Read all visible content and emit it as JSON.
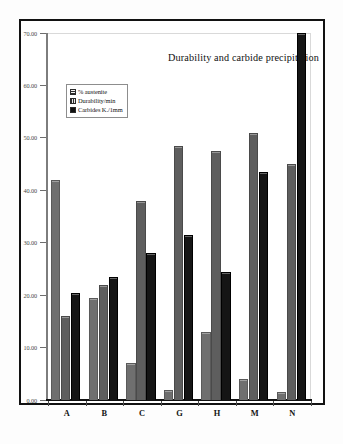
{
  "page": {
    "source_note": "Source: Inst. Paleochem. Sedimentologica"
  },
  "chart_data": {
    "type": "bar",
    "title": "Durability and carbide precipitation",
    "xlabel": "",
    "ylabel": "",
    "ylim": [
      0,
      70
    ],
    "grid": false,
    "legend_position": "top-left",
    "categories": [
      "A",
      "B",
      "C",
      "G",
      "H",
      "M",
      "N"
    ],
    "y_ticks": [
      "0.00",
      "10.00",
      "20.00",
      "30.00",
      "40.00",
      "50.00",
      "60.00",
      "70.00"
    ],
    "y_tick_values": [
      0,
      10,
      20,
      30,
      40,
      50,
      60,
      70
    ],
    "series": [
      {
        "name": "% austenite",
        "values": [
          42.0,
          19.5,
          7.0,
          2.0,
          13.0,
          4.0,
          1.5
        ]
      },
      {
        "name": "Durability/min",
        "values": [
          16.0,
          22.0,
          38.0,
          48.5,
          47.5,
          51.0,
          45.0
        ]
      },
      {
        "name": "Carbides K./1mm",
        "values": [
          20.5,
          23.5,
          28.0,
          31.5,
          24.5,
          43.5,
          70.0
        ]
      }
    ],
    "colors": {
      "series_0": "#6f6f6f",
      "series_1": "#5e5e5e",
      "series_2": "#151515",
      "axis": "#111111",
      "frame": "#121212"
    }
  }
}
